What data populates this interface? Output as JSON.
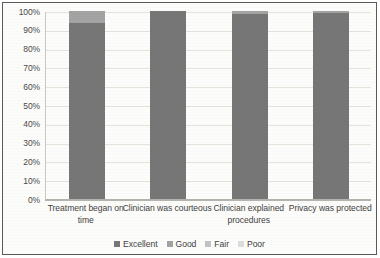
{
  "chart_data": {
    "type": "bar",
    "subtype": "stacked-100-percent",
    "title": "",
    "xlabel": "",
    "ylabel": "",
    "ylim": [
      0,
      100
    ],
    "ytick_labels": [
      "100%",
      "90%",
      "80%",
      "70%",
      "60%",
      "50%",
      "40%",
      "30%",
      "20%",
      "10%",
      "0%"
    ],
    "ytick_values": [
      100,
      90,
      80,
      70,
      60,
      50,
      40,
      30,
      20,
      10,
      0
    ],
    "grid": true,
    "legend_position": "bottom",
    "categories": [
      "Treatment began on time",
      "Clinician was courteous",
      "Clinician explained procedures",
      "Privacy was protected"
    ],
    "series": [
      {
        "name": "Excellent",
        "color": "#767676",
        "values": [
          93.5,
          100,
          98.5,
          99
        ]
      },
      {
        "name": "Good",
        "color": "#a3a3a3",
        "values": [
          6.5,
          0,
          1.5,
          1
        ]
      },
      {
        "name": "Fair",
        "color": "#c2c2c2",
        "values": [
          0,
          0,
          0,
          0
        ]
      },
      {
        "name": "Poor",
        "color": "#dcdcdc",
        "values": [
          0,
          0,
          0,
          0
        ]
      }
    ]
  },
  "legend": {
    "items": [
      {
        "label": "Excellent",
        "color": "#767676"
      },
      {
        "label": "Good",
        "color": "#a3a3a3"
      },
      {
        "label": "Fair",
        "color": "#c2c2c2"
      },
      {
        "label": "Poor",
        "color": "#dcdcdc"
      }
    ]
  }
}
